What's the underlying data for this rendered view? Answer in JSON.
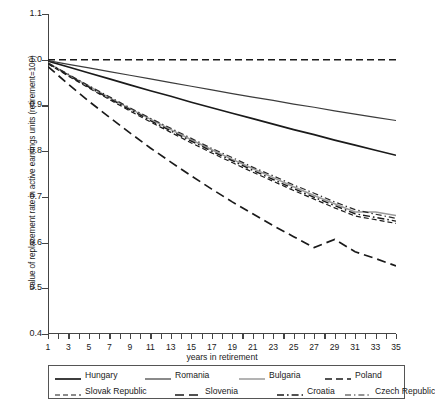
{
  "chart_data": {
    "type": "line",
    "title": "",
    "xlabel": "years in retirement",
    "ylabel": "value of replacement rate in active earnings units (retirement=100)",
    "xlim": [
      1,
      35
    ],
    "ylim": [
      0.4,
      1.1
    ],
    "grid": false,
    "legend_position": "bottom",
    "x": [
      1,
      3,
      5,
      7,
      9,
      11,
      13,
      15,
      17,
      19,
      21,
      23,
      25,
      27,
      29,
      31,
      33,
      35
    ],
    "xtick_labels": [
      "1",
      "3",
      "5",
      "7",
      "9",
      "11",
      "13",
      "15",
      "17",
      "19",
      "21",
      "23",
      "25",
      "27",
      "29",
      "31",
      "33",
      "35"
    ],
    "ytick_labels": [
      "0.4",
      "0.5",
      "0.6",
      "0.7",
      "0.8",
      "0.9",
      "1.0",
      "1.1"
    ],
    "ytick_values": [
      0.4,
      0.5,
      0.6,
      0.7,
      0.8,
      0.9,
      1.0,
      1.1
    ],
    "series": [
      {
        "name": "Hungary",
        "style": "solid",
        "color": "#1a1a1a",
        "width": 1.7,
        "values": [
          0.997,
          0.984,
          0.971,
          0.958,
          0.945,
          0.932,
          0.92,
          0.907,
          0.895,
          0.883,
          0.871,
          0.859,
          0.847,
          0.836,
          0.824,
          0.813,
          0.802,
          0.791
        ]
      },
      {
        "name": "Romania",
        "style": "solid",
        "color": "#3c3c3c",
        "width": 1.2,
        "values": [
          0.998,
          0.99,
          0.982,
          0.974,
          0.966,
          0.958,
          0.95,
          0.942,
          0.934,
          0.926,
          0.918,
          0.911,
          0.903,
          0.896,
          0.888,
          0.881,
          0.874,
          0.867
        ]
      },
      {
        "name": "Bulgaria",
        "style": "solid",
        "color": "#9a9a9a",
        "width": 1.5,
        "values": [
          0.993,
          0.967,
          0.942,
          0.917,
          0.893,
          0.87,
          0.847,
          0.825,
          0.803,
          0.782,
          0.762,
          0.742,
          0.722,
          0.703,
          0.685,
          0.667,
          0.667,
          0.659
        ]
      },
      {
        "name": "Poland",
        "style": "dashed",
        "color": "#1a1a1a",
        "width": 1.6,
        "values": [
          1.0,
          1.0,
          1.0,
          1.0,
          1.0,
          1.0,
          1.0,
          1.0,
          1.0,
          1.0,
          1.0,
          1.0,
          1.0,
          1.0,
          1.0,
          1.0,
          1.0,
          1.0
        ]
      },
      {
        "name": "Slovak Republic",
        "style": "dashed-fine",
        "color": "#1a1a1a",
        "width": 1.2,
        "values": [
          0.991,
          0.964,
          0.938,
          0.913,
          0.888,
          0.864,
          0.841,
          0.818,
          0.796,
          0.775,
          0.754,
          0.734,
          0.714,
          0.695,
          0.676,
          0.658,
          0.65,
          0.642
        ]
      },
      {
        "name": "Slovenia",
        "style": "long-dash",
        "color": "#1a1a1a",
        "width": 1.7,
        "values": [
          0.985,
          0.946,
          0.909,
          0.874,
          0.84,
          0.807,
          0.776,
          0.746,
          0.717,
          0.689,
          0.663,
          0.637,
          0.613,
          0.589,
          0.607,
          0.58,
          0.565,
          0.549
        ]
      },
      {
        "name": "Croatia",
        "style": "dash-dot",
        "color": "#1a1a1a",
        "width": 1.4,
        "values": [
          0.992,
          0.966,
          0.94,
          0.915,
          0.891,
          0.867,
          0.844,
          0.822,
          0.8,
          0.779,
          0.758,
          0.738,
          0.718,
          0.699,
          0.681,
          0.663,
          0.655,
          0.647
        ]
      },
      {
        "name": "Czech Republic",
        "style": "dash-dot-fine",
        "color": "#2a2a2a",
        "width": 1.2,
        "values": [
          0.993,
          0.968,
          0.943,
          0.919,
          0.895,
          0.872,
          0.85,
          0.828,
          0.806,
          0.786,
          0.765,
          0.746,
          0.726,
          0.708,
          0.689,
          0.672,
          0.662,
          0.653
        ]
      }
    ]
  },
  "legend": {
    "row1": [
      {
        "label": "Hungary"
      },
      {
        "label": "Romania"
      },
      {
        "label": "Bulgaria"
      },
      {
        "label": "Poland"
      }
    ],
    "row2": [
      {
        "label": "Slovak Republic"
      },
      {
        "label": "Slovenia"
      },
      {
        "label": "Croatia"
      },
      {
        "label": "Czech Republic"
      }
    ]
  }
}
